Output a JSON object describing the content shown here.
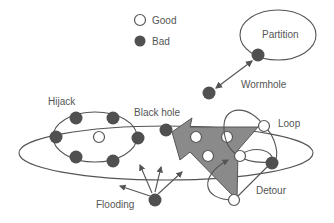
{
  "legend": {
    "good_label": "Good",
    "bad_label": "Bad"
  },
  "labels": {
    "partition": "Partition",
    "wormhole": "Wormhole",
    "hijack": "Hijack",
    "black_hole": "Black hole",
    "loop": "Loop",
    "detour": "Detour",
    "flooding": "Flooding"
  },
  "colors": {
    "bad_node": "#505050",
    "good_node": "#ffffff",
    "stroke": "#555555",
    "arrow_fill": "#8a8a8a",
    "text": "#555555"
  }
}
